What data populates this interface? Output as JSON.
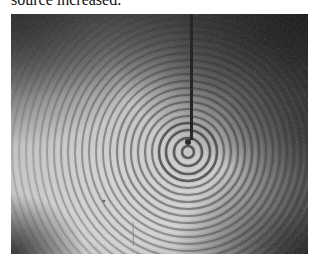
{
  "caption": {
    "text": "source increased."
  },
  "figure": {
    "source_center": {
      "x": 177,
      "y": 138
    },
    "rod": {
      "x": 180,
      "top": 0,
      "bottom": 126,
      "width": 3
    },
    "ring_spacing_px": 7,
    "ring_count": 40,
    "colors": {
      "bright": "#dcdcdc",
      "mid": "#8a8a8a",
      "dark": "#1c1c1c",
      "ring_dark": "#3a3a3a",
      "rod": "#141414"
    },
    "artifacts": [
      {
        "type": "speck",
        "x": 93,
        "y": 187
      },
      {
        "type": "streak",
        "x": 122,
        "y1": 208,
        "y2": 232
      }
    ]
  }
}
